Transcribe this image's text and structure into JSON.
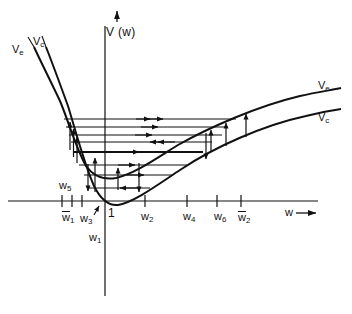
{
  "figure": {
    "type": "potential-energy-diagram",
    "axes": {
      "y_label": "V (w)",
      "y_arrow": "up-arrow",
      "x_label": "w",
      "x_arrow": "right-arrow"
    },
    "curve_labels": {
      "left_excited": "V",
      "left_excited_sub": "e",
      "left_ground": "V",
      "left_ground_sub": "c",
      "right_excited": "V",
      "right_excited_sub": "e",
      "right_ground": "V",
      "right_ground_sub": "c"
    },
    "tick_labels": [
      {
        "base": "w",
        "sub": "1",
        "overbar": true,
        "x": 62,
        "y": 211
      },
      {
        "base": "w",
        "sub": "3",
        "overbar": false,
        "x": 80,
        "y": 213
      },
      {
        "base": "w",
        "sub": "5",
        "overbar": false,
        "x": 59,
        "y": 180
      },
      {
        "base": "w",
        "sub": "1",
        "overbar": false,
        "x": 89,
        "y": 232
      },
      {
        "base": "w",
        "sub": "2",
        "overbar": false,
        "x": 141,
        "y": 211
      },
      {
        "base": "w",
        "sub": "4",
        "overbar": false,
        "x": 183,
        "y": 211
      },
      {
        "base": "w",
        "sub": "6",
        "overbar": false,
        "x": 214,
        "y": 211
      },
      {
        "base": "w",
        "sub": "2",
        "overbar": true,
        "x": 238,
        "y": 211
      }
    ],
    "origin_label": "1"
  },
  "chart_data": {
    "type": "line",
    "title": "",
    "xlabel": "w",
    "ylabel": "V (w)",
    "grid": false,
    "legend": [
      "Ve",
      "Vc"
    ],
    "axis_origin_px": [
      105,
      201
    ],
    "series": [
      {
        "name": "Ve",
        "description": "excited-state potential curve, minimum near w3",
        "points_px": [
          [
            34,
            47
          ],
          [
            40,
            58
          ],
          [
            47,
            72
          ],
          [
            54,
            88
          ],
          [
            60,
            101
          ],
          [
            66,
            118
          ],
          [
            71,
            132
          ],
          [
            76,
            146
          ],
          [
            82,
            160
          ],
          [
            88,
            170
          ],
          [
            95,
            176
          ],
          [
            103,
            179
          ],
          [
            112,
            179
          ],
          [
            122,
            176
          ],
          [
            133,
            171
          ],
          [
            145,
            164
          ],
          [
            158,
            156
          ],
          [
            172,
            147
          ],
          [
            188,
            138
          ],
          [
            204,
            130
          ],
          [
            222,
            122
          ],
          [
            242,
            114
          ],
          [
            262,
            107
          ],
          [
            282,
            101
          ],
          [
            302,
            96
          ],
          [
            322,
            92
          ],
          [
            340,
            89
          ]
        ]
      },
      {
        "name": "Vc",
        "description": "ground-state potential curve, minimum near w1",
        "points_px": [
          [
            46,
            47
          ],
          [
            52,
            62
          ],
          [
            57,
            76
          ],
          [
            62,
            90
          ],
          [
            66,
            102
          ],
          [
            71,
            117
          ],
          [
            75,
            131
          ],
          [
            79,
            146
          ],
          [
            84,
            163
          ],
          [
            88,
            177
          ],
          [
            93,
            190
          ],
          [
            98,
            199
          ],
          [
            104,
            204
          ],
          [
            111,
            206
          ],
          [
            119,
            204
          ],
          [
            129,
            199
          ],
          [
            140,
            192
          ],
          [
            152,
            184
          ],
          [
            166,
            175
          ],
          [
            181,
            166
          ],
          [
            198,
            157
          ],
          [
            216,
            148
          ],
          [
            236,
            139
          ],
          [
            256,
            131
          ],
          [
            276,
            124
          ],
          [
            298,
            118
          ],
          [
            320,
            113
          ],
          [
            341,
            110
          ]
        ]
      }
    ],
    "transition_levels_px": [
      {
        "y": 119,
        "x_left": 64,
        "x_right": 236,
        "arrows": [
          "right"
        ]
      },
      {
        "y": 127,
        "x_left": 66,
        "x_right": 228,
        "arrows": [
          "right"
        ]
      },
      {
        "y": 135,
        "x_left": 69,
        "x_right": 222,
        "arrows": [
          "right"
        ]
      },
      {
        "y": 142,
        "x_left": 71,
        "x_right": 212,
        "arrows": [
          "left"
        ]
      },
      {
        "y": 152,
        "x_left": 74,
        "x_right": 203,
        "arrows": [
          "right"
        ]
      },
      {
        "y": 165,
        "x_left": 79,
        "x_right": 187,
        "arrows": [
          "right"
        ]
      },
      {
        "y": 175,
        "x_left": 84,
        "x_right": 173,
        "arrows": [
          "right"
        ]
      },
      {
        "y": 188,
        "x_left": 89,
        "x_right": 150,
        "arrows": [
          "left"
        ]
      }
    ],
    "vertical_arrows_px": [
      {
        "x": 73,
        "y_from": 152,
        "y_to": 124,
        "dir": "up"
      },
      {
        "x": 77,
        "y_from": 160,
        "y_to": 131,
        "dir": "up"
      },
      {
        "x": 70,
        "y_from": 147,
        "y_to": 120,
        "dir": "up"
      },
      {
        "x": 95,
        "y_from": 192,
        "y_to": 157,
        "dir": "up"
      },
      {
        "x": 118,
        "y_from": 190,
        "y_to": 167,
        "dir": "up"
      },
      {
        "x": 93,
        "y_from": 162,
        "y_to": 190,
        "dir": "down"
      },
      {
        "x": 139,
        "y_from": 163,
        "y_to": 192,
        "dir": "down"
      },
      {
        "x": 211,
        "y_from": 151,
        "y_to": 129,
        "dir": "up"
      },
      {
        "x": 226,
        "y_from": 145,
        "y_to": 122,
        "dir": "up"
      },
      {
        "x": 246,
        "y_from": 136,
        "y_to": 113,
        "dir": "up"
      },
      {
        "x": 206,
        "y_from": 133,
        "y_to": 158,
        "dir": "down"
      }
    ],
    "x_ticks_px": [
      62,
      72,
      82,
      105,
      145,
      187,
      217,
      241
    ]
  }
}
